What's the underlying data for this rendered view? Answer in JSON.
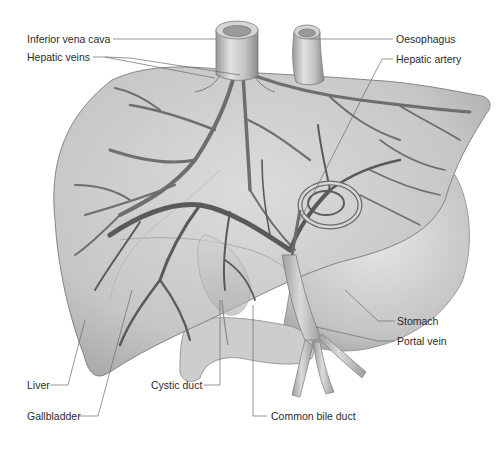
{
  "diagram": {
    "colors": {
      "background": "#ffffff",
      "organ_fill": "#c9c9c9",
      "organ_outline": "#7a7a7a",
      "vessel": "#6e6e6e",
      "label_text": "#2b2b2b",
      "leader_line": "#6a6a6a"
    },
    "labels": {
      "inferior_vena_cava": "Inferior vena cava",
      "hepatic_veins": "Hepatic veins",
      "oesophagus": "Oesophagus",
      "hepatic_artery": "Hepatic artery",
      "stomach": "Stomach",
      "portal_vein": "Portal vein",
      "liver": "Liver",
      "cystic_duct": "Cystic duct",
      "gallbladder": "Gallbladder",
      "common_bile_duct": "Common bile duct"
    }
  }
}
